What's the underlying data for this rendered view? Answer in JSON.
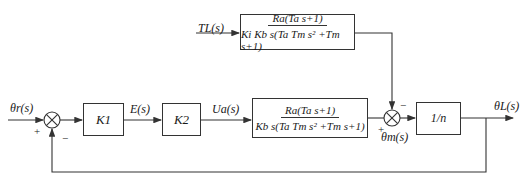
{
  "diagram": {
    "type": "block-diagram",
    "signals": {
      "input": "θr(s)",
      "error": "E(s)",
      "armature_voltage": "Ua(s)",
      "load_torque": "TL(s)",
      "motor_angle": "θm(s)",
      "output": "θL(s)"
    },
    "blocks": {
      "k1": {
        "label": "K1"
      },
      "k2": {
        "label": "K2"
      },
      "plant": {
        "numerator": "Ra(Ta s+1)",
        "denominator": "Kb s(Ta Tm s² +Tm s+1)"
      },
      "disturbance": {
        "numerator": "Ra(Ta s+1)",
        "denominator": "Ki Kb s(Ta Tm s² +Tm s+1)"
      },
      "gear": {
        "label": "1/n"
      }
    },
    "junctions": {
      "sum1": {
        "plus": "+",
        "minus": "−"
      },
      "sum2": {
        "plus": "+",
        "minus": "−"
      }
    },
    "colors": {
      "line": "#333333",
      "background": "#ffffff"
    }
  }
}
